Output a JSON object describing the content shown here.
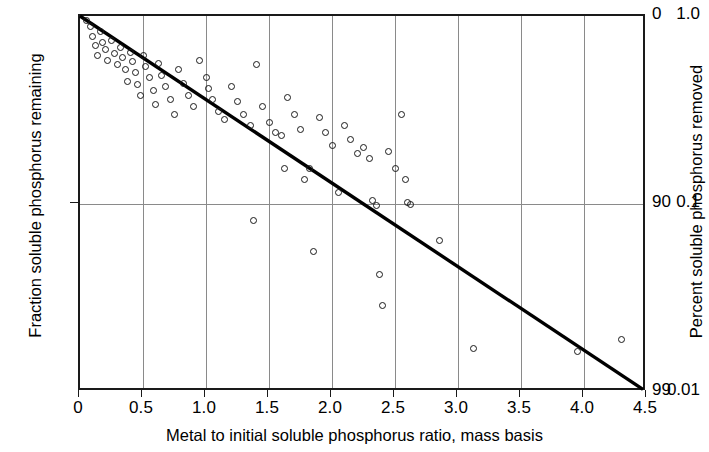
{
  "chart_data": {
    "type": "scatter",
    "title": "",
    "xlabel": "Metal to initial soluble phosphorus ratio, mass basis",
    "ylabel": "Fraction soluble phosphorus remaining",
    "ylabel_right": "Percent soluble phosphorus removed",
    "xlim": [
      0,
      4.5
    ],
    "ylim": [
      0.01,
      1.0
    ],
    "yscale": "log",
    "xscale": "linear",
    "grid": true,
    "legend": null,
    "xticks": [
      0,
      0.5,
      1.0,
      1.5,
      2.0,
      2.5,
      3.0,
      3.5,
      4.0,
      4.5
    ],
    "xticklabels": [
      "0",
      "0.5",
      "1.0",
      "1.5",
      "2.0",
      "2.5",
      "3.0",
      "3.5",
      "4.0",
      "4.5"
    ],
    "yticks": [
      1.0,
      0.1,
      0.01
    ],
    "yticklabels": [
      "1.0",
      "0.1",
      "0.01"
    ],
    "yticks_right": [
      1.0,
      0.1,
      0.01
    ],
    "yticklabels_right": [
      "0",
      "90",
      "99"
    ],
    "series": [
      {
        "name": "observations",
        "marker": "open-circle",
        "color": "#1a1a1a",
        "points": [
          [
            0.05,
            0.95
          ],
          [
            0.08,
            0.88
          ],
          [
            0.1,
            0.78
          ],
          [
            0.12,
            0.7
          ],
          [
            0.14,
            0.62
          ],
          [
            0.16,
            0.83
          ],
          [
            0.18,
            0.72
          ],
          [
            0.2,
            0.66
          ],
          [
            0.22,
            0.58
          ],
          [
            0.25,
            0.74
          ],
          [
            0.27,
            0.63
          ],
          [
            0.3,
            0.55
          ],
          [
            0.32,
            0.68
          ],
          [
            0.34,
            0.6
          ],
          [
            0.36,
            0.52
          ],
          [
            0.38,
            0.45
          ],
          [
            0.4,
            0.64
          ],
          [
            0.42,
            0.57
          ],
          [
            0.44,
            0.5
          ],
          [
            0.46,
            0.43
          ],
          [
            0.48,
            0.38
          ],
          [
            0.5,
            0.62
          ],
          [
            0.52,
            0.54
          ],
          [
            0.55,
            0.47
          ],
          [
            0.58,
            0.4
          ],
          [
            0.6,
            0.34
          ],
          [
            0.62,
            0.56
          ],
          [
            0.65,
            0.48
          ],
          [
            0.68,
            0.42
          ],
          [
            0.72,
            0.36
          ],
          [
            0.75,
            0.3
          ],
          [
            0.78,
            0.52
          ],
          [
            0.82,
            0.44
          ],
          [
            0.86,
            0.38
          ],
          [
            0.9,
            0.33
          ],
          [
            0.95,
            0.58
          ],
          [
            1.0,
            0.47
          ],
          [
            1.02,
            0.41
          ],
          [
            1.05,
            0.36
          ],
          [
            1.1,
            0.31
          ],
          [
            1.15,
            0.28
          ],
          [
            1.2,
            0.42
          ],
          [
            1.25,
            0.35
          ],
          [
            1.3,
            0.3
          ],
          [
            1.35,
            0.26
          ],
          [
            1.38,
            0.082
          ],
          [
            1.4,
            0.55
          ],
          [
            1.45,
            0.33
          ],
          [
            1.5,
            0.27
          ],
          [
            1.55,
            0.24
          ],
          [
            1.6,
            0.23
          ],
          [
            1.62,
            0.155
          ],
          [
            1.65,
            0.37
          ],
          [
            1.7,
            0.3
          ],
          [
            1.75,
            0.25
          ],
          [
            1.78,
            0.135
          ],
          [
            1.82,
            0.155
          ],
          [
            1.85,
            0.056
          ],
          [
            1.9,
            0.29
          ],
          [
            1.95,
            0.24
          ],
          [
            2.0,
            0.205
          ],
          [
            2.05,
            0.115
          ],
          [
            2.1,
            0.26
          ],
          [
            2.15,
            0.22
          ],
          [
            2.2,
            0.185
          ],
          [
            2.25,
            0.2
          ],
          [
            2.3,
            0.175
          ],
          [
            2.32,
            0.105
          ],
          [
            2.35,
            0.098
          ],
          [
            2.38,
            0.042
          ],
          [
            2.4,
            0.029
          ],
          [
            2.45,
            0.19
          ],
          [
            2.5,
            0.155
          ],
          [
            2.55,
            0.3
          ],
          [
            2.58,
            0.135
          ],
          [
            2.6,
            0.102
          ],
          [
            2.62,
            0.1
          ],
          [
            2.85,
            0.064
          ],
          [
            3.12,
            0.017
          ],
          [
            3.95,
            0.0165
          ],
          [
            4.3,
            0.019
          ]
        ]
      }
    ],
    "fit_line": {
      "name": "regression line",
      "x": [
        0,
        4.5
      ],
      "y": [
        1.0,
        0.01
      ],
      "color": "#000000",
      "width": 3.4
    }
  }
}
